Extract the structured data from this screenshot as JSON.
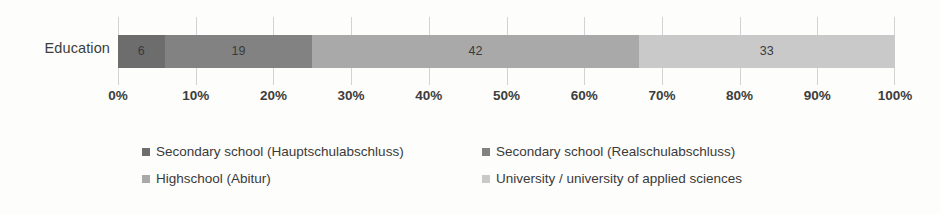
{
  "chart": {
    "type": "bar",
    "category_label": "Education"
  },
  "chart_data": {
    "type": "bar",
    "title": "",
    "subtitle": "",
    "xlabel": "",
    "ylabel": "",
    "orientation": "horizontal",
    "stacked": true,
    "normalized_percent": true,
    "grid": true,
    "legend_position": "bottom",
    "categories": [
      "Education"
    ],
    "xlim": [
      0,
      100
    ],
    "xticks": [
      0,
      10,
      20,
      30,
      40,
      50,
      60,
      70,
      80,
      90,
      100
    ],
    "xtick_labels": [
      "0%",
      "10%",
      "20%",
      "30%",
      "40%",
      "50%",
      "60%",
      "70%",
      "80%",
      "90%",
      "100%"
    ],
    "series": [
      {
        "name": "Secondary school (Hauptschulabschluss)",
        "values": [
          6
        ],
        "label": "6",
        "color": "#6d6d6d",
        "cumulative_start": 0,
        "cumulative_end": 6
      },
      {
        "name": "Secondary school (Realschulabschluss)",
        "values": [
          19
        ],
        "label": "19",
        "color": "#828282",
        "cumulative_start": 6,
        "cumulative_end": 25
      },
      {
        "name": "Highschool (Abitur)",
        "values": [
          42
        ],
        "label": "42",
        "color": "#a9a9a9",
        "cumulative_start": 25,
        "cumulative_end": 67
      },
      {
        "name": "University / university of applied sciences",
        "values": [
          33
        ],
        "label": "33",
        "color": "#c9c9c9",
        "cumulative_start": 67,
        "cumulative_end": 100
      }
    ]
  },
  "legend": {
    "entries": [
      {
        "label": "Secondary school (Hauptschulabschluss)",
        "color": "#6d6d6d"
      },
      {
        "label": "Secondary school (Realschulabschluss)",
        "color": "#828282"
      },
      {
        "label": "Highschool (Abitur)",
        "color": "#a9a9a9"
      },
      {
        "label": "University / university of applied sciences",
        "color": "#c9c9c9"
      }
    ]
  }
}
